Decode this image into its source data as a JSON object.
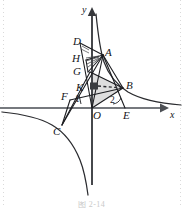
{
  "figure": {
    "caption": "图 2-14",
    "width": 183,
    "height": 208,
    "colors": {
      "ink": "#15161a",
      "axis": "#6f7277",
      "shade_fill": "#c9c9c9",
      "curve": "#2a2b2f",
      "caption": "#c9c9c9"
    },
    "axes": {
      "x_label": "x",
      "y_label": "y",
      "origin_label": "O",
      "x_arrow": "arrow-right",
      "y_arrow": "arrow-up"
    },
    "points": [
      {
        "id": "D",
        "label": "D",
        "x": 80,
        "y": 43,
        "lx": 74,
        "ly": 38
      },
      {
        "id": "A",
        "label": "A",
        "x": 103,
        "y": 55,
        "lx": 105,
        "ly": 49
      },
      {
        "id": "H",
        "label": "H",
        "x": 92,
        "y": 60,
        "lx": 74,
        "ly": 55
      },
      {
        "id": "G",
        "label": "G",
        "x": 92,
        "y": 72,
        "lx": 75,
        "ly": 68
      },
      {
        "id": "K",
        "label": "K",
        "x": 84,
        "y": 88,
        "lx": 78,
        "ly": 84
      },
      {
        "id": "F",
        "label": "F",
        "x": 72,
        "y": 97,
        "lx": 63,
        "ly": 93
      },
      {
        "id": "C",
        "label": "C",
        "x": 62,
        "y": 125,
        "lx": 55,
        "ly": 127
      },
      {
        "id": "O",
        "label": "O",
        "x": 92,
        "y": 108,
        "lx": 94,
        "ly": 111
      },
      {
        "id": "B",
        "label": "B",
        "x": 123,
        "y": 88,
        "lx": 126,
        "ly": 83
      },
      {
        "id": "E",
        "label": "E",
        "x": 125,
        "y": 108,
        "lx": 124,
        "ly": 111
      }
    ],
    "numeric_labels": [
      {
        "value": "1",
        "x": 76,
        "y": 97
      },
      {
        "value": "2",
        "x": 112,
        "y": 99
      }
    ],
    "markers": {
      "right_angle_square": {
        "x": 92,
        "y": 84,
        "size": 7
      },
      "dashed_segment": {
        "from": "right-angle-square",
        "to": "B"
      }
    },
    "shaded_region": {
      "name": "triangle-G-B-O",
      "vertices": [
        "G",
        "B",
        "O"
      ],
      "fill": "#c9c9c9",
      "opacity": 0.55
    },
    "curve": {
      "type": "hyperbola",
      "branches": [
        "quadrant-I",
        "quadrant-III"
      ],
      "description": "two-branch rectangular hyperbola"
    },
    "segments": [
      {
        "from": "D",
        "to": "O",
        "style": "solid"
      },
      {
        "from": "D",
        "to": "A",
        "style": "solid"
      },
      {
        "from": "A",
        "to": "O",
        "style": "solid"
      },
      {
        "from": "A",
        "to": "B",
        "style": "solid"
      },
      {
        "from": "A",
        "to": "E",
        "style": "solid"
      },
      {
        "from": "A",
        "to": "H",
        "style": "solid"
      },
      {
        "from": "H",
        "to": "G",
        "style": "solid"
      },
      {
        "from": "G",
        "to": "B",
        "style": "solid"
      },
      {
        "from": "G",
        "to": "C",
        "style": "solid"
      },
      {
        "from": "O",
        "to": "B",
        "style": "solid"
      },
      {
        "from": "F",
        "to": "B",
        "style": "solid"
      },
      {
        "from": "F",
        "to": "C",
        "style": "solid"
      },
      {
        "from": "C",
        "to": "A",
        "style": "solid"
      },
      {
        "from": "K",
        "to": "B",
        "style": "dashed"
      }
    ]
  }
}
